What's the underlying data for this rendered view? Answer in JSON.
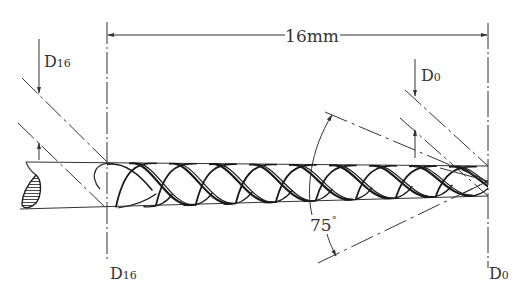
{
  "diagram": {
    "type": "technical-drawing",
    "colors": {
      "line": "#333333",
      "background": "#ffffff"
    },
    "labels": {
      "length_dimension": "16mm",
      "d16_top_main": "D",
      "d16_top_sub": "16",
      "d0_top_main": "D",
      "d0_top_sub": "0",
      "d16_bottom_main": "D",
      "d16_bottom_sub": "16",
      "d0_bottom_main": "D",
      "d0_bottom_sub": "0",
      "angle_value": "75",
      "angle_unit": "°"
    }
  }
}
